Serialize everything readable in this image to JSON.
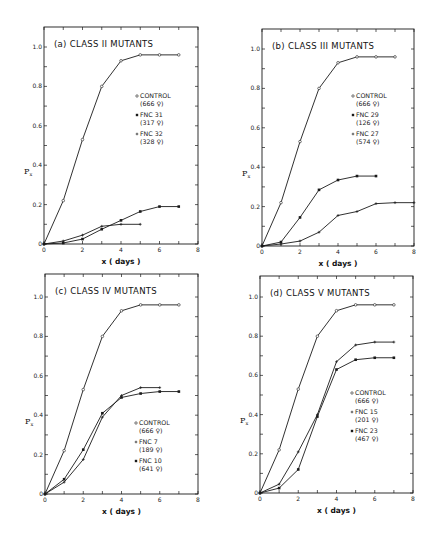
{
  "figure": {
    "background": "#ffffff",
    "ink": "#1a1a1a"
  },
  "chart_data": [
    {
      "type": "line",
      "id": "a",
      "title": "(a) CLASS II MUTANTS",
      "xlabel": "x (days)",
      "ylabel": "Px",
      "xlim": [
        0,
        8
      ],
      "ylim": [
        0,
        1.0
      ],
      "xticks": [
        "0",
        "2",
        "4",
        "6",
        "8"
      ],
      "yticks": [
        "0",
        "0.2",
        "0.4",
        "0.6",
        "0.8",
        "1.0"
      ],
      "legend_position": "right-middle",
      "series": [
        {
          "name": "CONTROL",
          "sub": "(666 ♀)",
          "marker": "open",
          "x": [
            0,
            1,
            2,
            3,
            4,
            5,
            6,
            7
          ],
          "values": [
            0.0,
            0.22,
            0.53,
            0.8,
            0.93,
            0.96,
            0.96,
            0.96
          ]
        },
        {
          "name": "FNC 31",
          "sub": "(317 ♀)",
          "marker": "filled",
          "x": [
            0,
            1,
            2,
            3,
            4,
            5,
            6,
            7
          ],
          "values": [
            0.0,
            0.005,
            0.025,
            0.075,
            0.12,
            0.165,
            0.19,
            0.19
          ]
        },
        {
          "name": "FNC 32",
          "sub": "(328 ♀)",
          "marker": "cross",
          "x": [
            0,
            1,
            2,
            3,
            4,
            5
          ],
          "values": [
            0.0,
            0.015,
            0.045,
            0.09,
            0.1,
            0.1
          ]
        }
      ]
    },
    {
      "type": "line",
      "id": "b",
      "title": "(b) CLASS III MUTANTS",
      "xlabel": "x (days)",
      "ylabel": "Px",
      "xlim": [
        0,
        8
      ],
      "ylim": [
        0,
        1.0
      ],
      "xticks": [
        "0",
        "2",
        "4",
        "6",
        "8"
      ],
      "yticks": [
        "0",
        "0.2",
        "0.4",
        "0.6",
        "0.8",
        "1.0"
      ],
      "legend_position": "right-middle",
      "series": [
        {
          "name": "CONTROL",
          "sub": "(666 ♀)",
          "marker": "open",
          "x": [
            0,
            1,
            2,
            3,
            4,
            5,
            6,
            7
          ],
          "values": [
            0.0,
            0.22,
            0.53,
            0.8,
            0.93,
            0.96,
            0.96,
            0.96
          ]
        },
        {
          "name": "FNC 29",
          "sub": "(126 ♀)",
          "marker": "filled",
          "x": [
            0,
            1,
            2,
            3,
            4,
            5,
            6
          ],
          "values": [
            0.0,
            0.02,
            0.145,
            0.285,
            0.335,
            0.355,
            0.355
          ]
        },
        {
          "name": "FNC 27",
          "sub": "(574 ♀)",
          "marker": "cross",
          "x": [
            0,
            1,
            2,
            3,
            4,
            5,
            6,
            7,
            8
          ],
          "values": [
            0.0,
            0.01,
            0.025,
            0.07,
            0.155,
            0.175,
            0.215,
            0.22,
            0.22
          ]
        }
      ]
    },
    {
      "type": "line",
      "id": "c",
      "title": "(c) CLASS IV MUTANTS",
      "xlabel": "x (days)",
      "ylabel": "Px",
      "xlim": [
        0,
        8
      ],
      "ylim": [
        0,
        1.0
      ],
      "xticks": [
        "0",
        "2",
        "4",
        "6",
        "8"
      ],
      "yticks": [
        "0",
        "0.2",
        "0.4",
        "0.6",
        "0.8",
        "1.0"
      ],
      "legend_position": "right-lower",
      "series": [
        {
          "name": "CONTROL",
          "sub": "(666 ♀)",
          "marker": "open",
          "x": [
            0,
            1,
            2,
            3,
            4,
            5,
            6,
            7
          ],
          "values": [
            0.0,
            0.22,
            0.53,
            0.8,
            0.93,
            0.96,
            0.96,
            0.96
          ]
        },
        {
          "name": "FNC 7",
          "sub": "(189 ♀)",
          "marker": "cross",
          "x": [
            0,
            1,
            2,
            3,
            4,
            5,
            6
          ],
          "values": [
            0.0,
            0.06,
            0.175,
            0.39,
            0.5,
            0.54,
            0.54
          ]
        },
        {
          "name": "FNC 10",
          "sub": "(641 ♀)",
          "marker": "filled",
          "x": [
            0,
            1,
            2,
            3,
            4,
            5,
            6,
            7
          ],
          "values": [
            0.0,
            0.075,
            0.225,
            0.41,
            0.49,
            0.51,
            0.52,
            0.52
          ]
        }
      ]
    },
    {
      "type": "line",
      "id": "d",
      "title": "(d) CLASS V MUTANTS",
      "xlabel": "x (days)",
      "ylabel": "Px",
      "xlim": [
        0,
        8
      ],
      "ylim": [
        0,
        1.0
      ],
      "xticks": [
        "0",
        "2",
        "4",
        "6",
        "8"
      ],
      "yticks": [
        "0",
        "0.2",
        "0.4",
        "0.6",
        "0.8",
        "1.0"
      ],
      "legend_position": "right-middle",
      "series": [
        {
          "name": "CONTROL",
          "sub": "(666 ♀)",
          "marker": "open",
          "x": [
            0,
            1,
            2,
            3,
            4,
            5,
            6,
            7
          ],
          "values": [
            0.0,
            0.22,
            0.53,
            0.8,
            0.93,
            0.96,
            0.96,
            0.96
          ]
        },
        {
          "name": "FNC 15",
          "sub": "(201 ♀)",
          "marker": "cross",
          "x": [
            0,
            1,
            2,
            3,
            4,
            5,
            6,
            7
          ],
          "values": [
            0.0,
            0.045,
            0.21,
            0.4,
            0.67,
            0.755,
            0.77,
            0.77
          ]
        },
        {
          "name": "FNC 23",
          "sub": "(467 ♀)",
          "marker": "filled",
          "x": [
            0,
            1,
            2,
            3,
            4,
            5,
            6,
            7
          ],
          "values": [
            0.0,
            0.025,
            0.12,
            0.39,
            0.63,
            0.68,
            0.69,
            0.69
          ]
        }
      ]
    }
  ],
  "layout": {
    "panels": [
      {
        "left": 44,
        "right": 198,
        "top": 27,
        "y1": 47,
        "y0": 244,
        "legend": {
          "x": 140,
          "y": 98
        }
      },
      {
        "left": 262,
        "right": 414,
        "top": 29,
        "y1": 49,
        "y0": 246,
        "legend": {
          "x": 356,
          "y": 98
        }
      },
      {
        "left": 45,
        "right": 198,
        "top": 274,
        "y1": 297,
        "y0": 494,
        "legend": {
          "x": 139,
          "y": 425
        }
      },
      {
        "left": 260,
        "right": 413,
        "top": 276,
        "y1": 297,
        "y0": 493,
        "legend": {
          "x": 355,
          "y": 395
        }
      }
    ]
  }
}
